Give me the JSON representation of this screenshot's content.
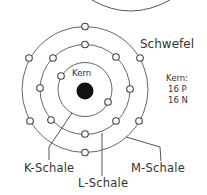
{
  "diagram": {
    "element_name": "Schwefel",
    "nucleus_label": "Kern",
    "nucleus_info": {
      "heading": "Kern:",
      "protons": "16 P",
      "neutrons": "16 N"
    },
    "shells": [
      {
        "name": "K-Schale",
        "electrons": 2
      },
      {
        "name": "L-Schale",
        "electrons": 8
      },
      {
        "name": "M-Schale",
        "electrons": 6
      }
    ],
    "colors": {
      "line": "#555555",
      "nucleus": "#111111",
      "text": "#333333"
    }
  }
}
